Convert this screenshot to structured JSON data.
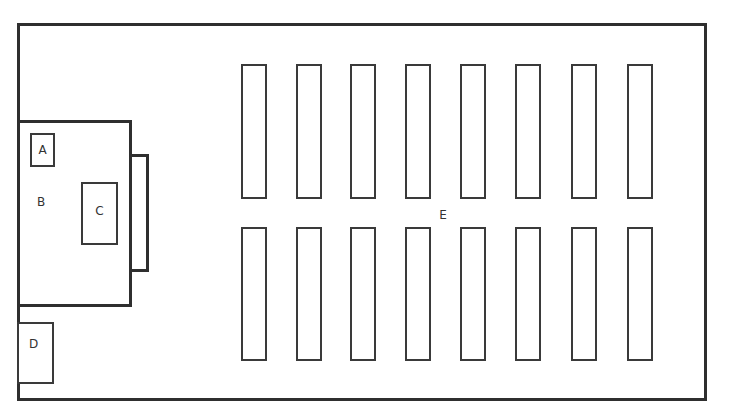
{
  "diagram": {
    "type": "floor-plan",
    "labels": {
      "A": "A",
      "B": "B",
      "C": "C",
      "D": "D",
      "E": "E"
    },
    "room": {
      "x": 17,
      "y": 23,
      "w": 690,
      "h": 378
    },
    "zones": {
      "B": {
        "x": 17,
        "y": 120,
        "w": 114,
        "h": 186
      },
      "B_tab": {
        "x": 129,
        "y": 154,
        "w": 19,
        "h": 117
      },
      "A": {
        "x": 30,
        "y": 133,
        "w": 24,
        "h": 33
      },
      "C": {
        "x": 81,
        "y": 182,
        "w": 37,
        "h": 62
      },
      "D": {
        "x": 17,
        "y": 322,
        "w": 37,
        "h": 61
      }
    },
    "desk_rows": [
      {
        "row": "top",
        "y": 64,
        "h": 135,
        "x": [
          241,
          296,
          350,
          405,
          460,
          515,
          571,
          627
        ],
        "w": 26
      },
      {
        "row": "bottom",
        "y": 227,
        "h": 134,
        "x": [
          241,
          296,
          350,
          405,
          460,
          515,
          571,
          627
        ],
        "w": 26
      }
    ]
  }
}
